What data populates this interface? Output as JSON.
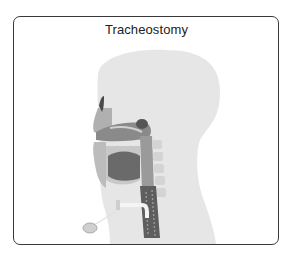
{
  "figure": {
    "title": "Tracheostomy",
    "illustration": "sagittal-head-neck-tracheostomy-illustration",
    "colors": {
      "border": "#3a3a3a",
      "silhouette": "#e6e6e6",
      "tissue_dark": "#6e6e6e",
      "tissue_mid": "#9a9a9a",
      "tissue_light": "#c4c4c4"
    }
  }
}
